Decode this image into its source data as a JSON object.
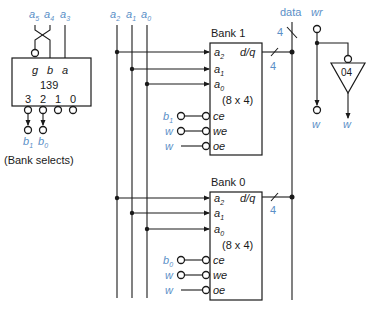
{
  "decoder": {
    "part_number": "139",
    "inputs": [
      {
        "pin": "g",
        "signal": "a",
        "sub": "5"
      },
      {
        "pin": "b",
        "signal": "a",
        "sub": "4"
      },
      {
        "pin": "a",
        "signal": "a",
        "sub": "3"
      }
    ],
    "outputs": [
      "3",
      "2",
      "1",
      "0"
    ],
    "bank_select_signals": [
      {
        "name": "b",
        "sub": "1"
      },
      {
        "name": "b",
        "sub": "0"
      }
    ],
    "caption": "(Bank selects)"
  },
  "address_bus": [
    {
      "name": "a",
      "sub": "2"
    },
    {
      "name": "a",
      "sub": "1"
    },
    {
      "name": "a",
      "sub": "0"
    }
  ],
  "data_bus": {
    "label": "data",
    "width": "4"
  },
  "write": {
    "input": "wr",
    "inverter_part": "04",
    "outputs": [
      "w",
      "w"
    ]
  },
  "banks": [
    {
      "title": "Bank 1",
      "size": "(8 x 4)",
      "address_pins": [
        {
          "name": "a",
          "sub": "2"
        },
        {
          "name": "a",
          "sub": "1"
        },
        {
          "name": "a",
          "sub": "0"
        }
      ],
      "data_pin": "d/q",
      "data_width": "4",
      "control_pins": [
        "ce",
        "we",
        "oe"
      ],
      "control_signals": [
        {
          "name": "b",
          "sub": "1"
        },
        {
          "name": "w",
          "sub": ""
        },
        {
          "name": "w",
          "sub": ""
        }
      ]
    },
    {
      "title": "Bank 0",
      "size": "(8 x 4)",
      "address_pins": [
        {
          "name": "a",
          "sub": "2"
        },
        {
          "name": "a",
          "sub": "1"
        },
        {
          "name": "a",
          "sub": "0"
        }
      ],
      "data_pin": "d/q",
      "data_width": "4",
      "control_pins": [
        "ce",
        "we",
        "oe"
      ],
      "control_signals": [
        {
          "name": "b",
          "sub": "0"
        },
        {
          "name": "w",
          "sub": ""
        },
        {
          "name": "w",
          "sub": ""
        }
      ]
    }
  ],
  "colors": {
    "signal_label": "#5b8fc7",
    "line": "#1a1a1a",
    "background": "#ffffff"
  }
}
